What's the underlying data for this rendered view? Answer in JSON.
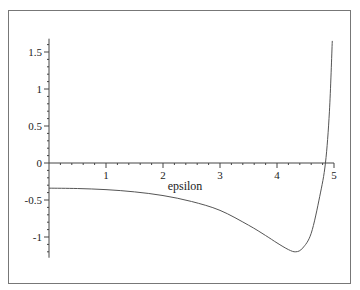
{
  "chart_data": {
    "type": "line",
    "title": "",
    "xlabel": "epsilon",
    "ylabel": "",
    "xlim": [
      0,
      5
    ],
    "ylim": [
      -1.28,
      1.68
    ],
    "grid": false,
    "legend": null,
    "x_ticks": [
      "1",
      "2",
      "3",
      "4",
      "5"
    ],
    "y_ticks": [
      "1.5",
      "1",
      "0.5",
      "0",
      "-0.5",
      "-1"
    ],
    "series": [
      {
        "name": "curve",
        "color": "#555555",
        "x": [
          0,
          0.5,
          1.0,
          1.5,
          2.0,
          2.5,
          3.0,
          3.5,
          3.8,
          4.0,
          4.2,
          4.33,
          4.45,
          4.6,
          4.75,
          4.85,
          4.92,
          4.97
        ],
        "y": [
          -0.34,
          -0.345,
          -0.36,
          -0.39,
          -0.44,
          -0.52,
          -0.64,
          -0.84,
          -0.98,
          -1.08,
          -1.17,
          -1.2,
          -1.15,
          -0.95,
          -0.45,
          0.0,
          0.7,
          1.65
        ]
      }
    ]
  }
}
